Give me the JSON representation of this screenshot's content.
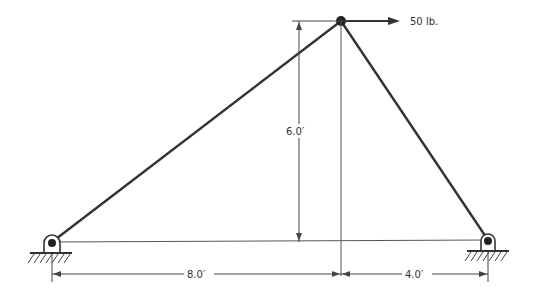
{
  "diagram": {
    "type": "truss",
    "load": {
      "label": "50 lb.",
      "direction": "right"
    },
    "dimensions": {
      "height": "6.0′",
      "left_span": "8.0′",
      "right_span": "4.0′"
    },
    "supports": [
      {
        "name": "left-pin-support",
        "type": "pin"
      },
      {
        "name": "right-pin-support",
        "type": "pin"
      }
    ],
    "colors": {
      "member": "#333333",
      "dimension": "#444444"
    }
  }
}
